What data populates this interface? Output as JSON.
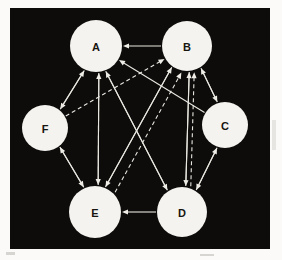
{
  "diagram": {
    "background_color": "#0d0c0b",
    "node_fill_color": "#f4f3ef",
    "edge_color": "#e9e7e0",
    "label_color": "#17150f",
    "panel": {
      "x": 10,
      "y": 8,
      "width": 260,
      "height": 241
    },
    "nodes": [
      {
        "id": "A",
        "label": "A",
        "cx": 86,
        "cy": 38,
        "r": 26
      },
      {
        "id": "B",
        "label": "B",
        "cx": 177,
        "cy": 38,
        "r": 25
      },
      {
        "id": "C",
        "label": "C",
        "cx": 215,
        "cy": 117,
        "r": 23
      },
      {
        "id": "D",
        "label": "D",
        "cx": 172,
        "cy": 204,
        "r": 25
      },
      {
        "id": "E",
        "label": "E",
        "cx": 85,
        "cy": 204,
        "r": 26
      },
      {
        "id": "F",
        "label": "F",
        "cx": 35,
        "cy": 120,
        "r": 23
      }
    ],
    "edges": [
      {
        "from": "B",
        "to": "A",
        "style": "solid",
        "offset": 0
      },
      {
        "from": "D",
        "to": "E",
        "style": "solid",
        "offset": 0
      },
      {
        "from": "A",
        "to": "F",
        "style": "solid",
        "offset": -3
      },
      {
        "from": "F",
        "to": "A",
        "style": "solid",
        "offset": 3
      },
      {
        "from": "F",
        "to": "E",
        "style": "solid",
        "offset": -3
      },
      {
        "from": "E",
        "to": "F",
        "style": "solid",
        "offset": 3
      },
      {
        "from": "A",
        "to": "E",
        "style": "solid",
        "offset": -3
      },
      {
        "from": "E",
        "to": "A",
        "style": "solid",
        "offset": 3
      },
      {
        "from": "B",
        "to": "D",
        "style": "solid",
        "offset": -3
      },
      {
        "from": "D",
        "to": "B",
        "style": "solid",
        "offset": 3
      },
      {
        "from": "B",
        "to": "C",
        "style": "solid",
        "offset": -3
      },
      {
        "from": "C",
        "to": "B",
        "style": "solid",
        "offset": 3
      },
      {
        "from": "C",
        "to": "D",
        "style": "solid",
        "offset": -3
      },
      {
        "from": "D",
        "to": "C",
        "style": "solid",
        "offset": 3
      },
      {
        "from": "E",
        "to": "B",
        "style": "solid",
        "offset": -3
      },
      {
        "from": "B",
        "to": "E",
        "style": "solid",
        "offset": 3
      },
      {
        "from": "D",
        "to": "A",
        "style": "solid",
        "offset": -3
      },
      {
        "from": "A",
        "to": "D",
        "style": "solid",
        "offset": 3
      },
      {
        "from": "C",
        "to": "A",
        "style": "solid",
        "offset": 0
      },
      {
        "from": "F",
        "to": "B",
        "style": "dashed",
        "offset": 0
      },
      {
        "from": "E",
        "to": "B",
        "style": "dashed",
        "offset": 8
      },
      {
        "from": "D",
        "to": "B",
        "style": "dashed",
        "offset": 8
      }
    ]
  }
}
